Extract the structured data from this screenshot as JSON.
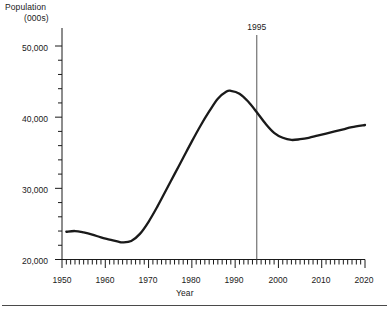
{
  "chart_data": {
    "type": "line",
    "title": "",
    "ylabel": "Population (000s)",
    "ylabel_line1": "Population",
    "ylabel_line2": "(000s)",
    "xlabel": "Year",
    "xlim": [
      1950,
      2020
    ],
    "ylim": [
      20000,
      50000
    ],
    "grid": false,
    "legend": null,
    "x_major_ticks": [
      1950,
      1960,
      1970,
      1980,
      1990,
      2000,
      2010,
      2020
    ],
    "x_major_tick_labels": [
      "1950",
      "1960",
      "1970",
      "1980",
      "1990",
      "2000",
      "2010",
      "2020"
    ],
    "x_minor_tick_interval": 1,
    "y_major_ticks": [
      20000,
      30000,
      40000,
      50000
    ],
    "y_major_tick_labels": [
      "20,000",
      "30,000",
      "40,000",
      "50,000"
    ],
    "y_minor_tick_interval": 2000,
    "line_color": "#1a1a1a",
    "annotations": [
      {
        "name": "year-marker",
        "label": "1995",
        "x": 1995,
        "type": "vertical-line",
        "color": "#555555"
      }
    ],
    "series": [
      {
        "name": "Population",
        "x": [
          1951,
          1953,
          1955,
          1957,
          1959,
          1961,
          1963,
          1964,
          1966,
          1968,
          1970,
          1972,
          1974,
          1976,
          1978,
          1980,
          1982,
          1984,
          1986,
          1988,
          1989,
          1991,
          1993,
          1995,
          1997,
          1999,
          2001,
          2003,
          2005,
          2007,
          2009,
          2011,
          2013,
          2015,
          2017,
          2020
        ],
        "values": [
          23900,
          24000,
          23800,
          23500,
          23100,
          22800,
          22500,
          22400,
          22600,
          23600,
          25300,
          27400,
          29700,
          32000,
          34300,
          36600,
          38800,
          40800,
          42600,
          43600,
          43700,
          43300,
          42200,
          40700,
          39100,
          37800,
          37100,
          36800,
          36900,
          37100,
          37400,
          37700,
          38000,
          38300,
          38600,
          38900
        ]
      }
    ]
  },
  "tick_labels": {
    "y": [
      "50,000",
      "40,000",
      "30,000",
      "20,000"
    ],
    "x": [
      "1950",
      "1960",
      "1970",
      "1980",
      "1990",
      "2000",
      "2010",
      "2020"
    ]
  },
  "axis_titles": {
    "y_line1": "Population",
    "y_line2": "(000s)",
    "x": "Year"
  },
  "annotation": {
    "label": "1995"
  }
}
